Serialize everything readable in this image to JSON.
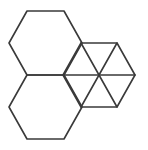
{
  "diagram": {
    "background": "#ffffff",
    "stroke_color": "#3a3a3a",
    "stroke_width": 1.6,
    "shapes": [
      {
        "name": "large-hexagon-top",
        "type": "hexagon",
        "points": [
          [
            27,
            11
          ],
          [
            64,
            11
          ],
          [
            82,
            43
          ],
          [
            64,
            75
          ],
          [
            27,
            75
          ],
          [
            9,
            43
          ]
        ]
      },
      {
        "name": "large-hexagon-bottom",
        "type": "hexagon",
        "points": [
          [
            27,
            75
          ],
          [
            64,
            75
          ],
          [
            82,
            107
          ],
          [
            64,
            139
          ],
          [
            27,
            139
          ],
          [
            9,
            107
          ]
        ]
      },
      {
        "name": "small-hexagon-right",
        "type": "hexagon",
        "points": [
          [
            81,
            43
          ],
          [
            117,
            43
          ],
          [
            135,
            75
          ],
          [
            117,
            107
          ],
          [
            81,
            107
          ],
          [
            63,
            75
          ]
        ]
      }
    ],
    "spokes": {
      "name": "small-hexagon-diagonals",
      "center": [
        99,
        75
      ],
      "segments": [
        [
          [
            63,
            75
          ],
          [
            135,
            75
          ]
        ],
        [
          [
            81,
            43
          ],
          [
            117,
            107
          ]
        ],
        [
          [
            117,
            43
          ],
          [
            81,
            107
          ]
        ]
      ]
    }
  }
}
